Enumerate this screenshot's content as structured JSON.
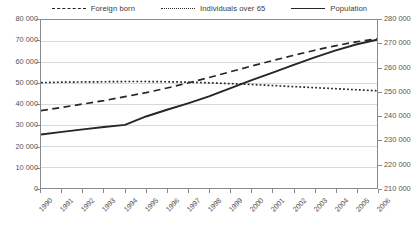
{
  "legend": {
    "items": [
      {
        "label": "Foreign born",
        "style": "dashed",
        "color": "#262626"
      },
      {
        "label": "Individuals over 65",
        "style": "dotted",
        "color": "#262626"
      },
      {
        "label": "Population",
        "style": "solid",
        "color": "#262626"
      }
    ]
  },
  "chart_data": {
    "type": "line",
    "title": "",
    "xlabel": "",
    "ylabel": "",
    "grid": true,
    "legend_position": "top",
    "x": [
      1990,
      1991,
      1992,
      1993,
      1994,
      1995,
      1996,
      1997,
      1998,
      1999,
      2000,
      2001,
      2002,
      2003,
      2004,
      2005,
      2006
    ],
    "categories": [
      "1990",
      "1991",
      "1992",
      "1993",
      "1994",
      "1995",
      "1996",
      "1997",
      "1998",
      "1999",
      "2000",
      "2001",
      "2002",
      "2003",
      "2004",
      "2005",
      "2006"
    ],
    "left_axis": {
      "ticks": [
        "0",
        "10 000",
        "20 000",
        "30 000",
        "40 000",
        "50 000",
        "60 000",
        "70 000",
        "80 000"
      ],
      "tick_values": [
        0,
        10000,
        20000,
        30000,
        40000,
        50000,
        60000,
        70000,
        80000
      ],
      "ylim": [
        0,
        80000
      ]
    },
    "right_axis": {
      "ticks": [
        "210 000",
        "220 000",
        "230 000",
        "240 000",
        "250 000",
        "260 000",
        "270 000",
        "280 000"
      ],
      "tick_values": [
        210000,
        220000,
        230000,
        240000,
        250000,
        260000,
        270000,
        280000
      ],
      "ylim": [
        210000,
        280000
      ]
    },
    "series": [
      {
        "name": "Foreign born",
        "axis": "left",
        "style": "dashed",
        "color": "#262626",
        "values": [
          36800,
          38400,
          40000,
          41600,
          43500,
          45400,
          47600,
          50000,
          52600,
          55300,
          58000,
          60600,
          63100,
          65500,
          67700,
          69600,
          71000
        ]
      },
      {
        "name": "Individuals over 65",
        "axis": "left",
        "style": "dotted",
        "color": "#262626",
        "values": [
          50200,
          50400,
          50500,
          50600,
          50700,
          50700,
          50600,
          50400,
          50100,
          49700,
          49300,
          48800,
          48300,
          47800,
          47300,
          46800,
          46300
        ]
      },
      {
        "name": "Population",
        "axis": "right",
        "style": "solid",
        "color": "#262626",
        "values": [
          232300,
          233400,
          234400,
          235400,
          236300,
          239800,
          242600,
          245300,
          248200,
          251500,
          254800,
          258000,
          261200,
          264300,
          267200,
          269800,
          271800
        ]
      }
    ]
  }
}
